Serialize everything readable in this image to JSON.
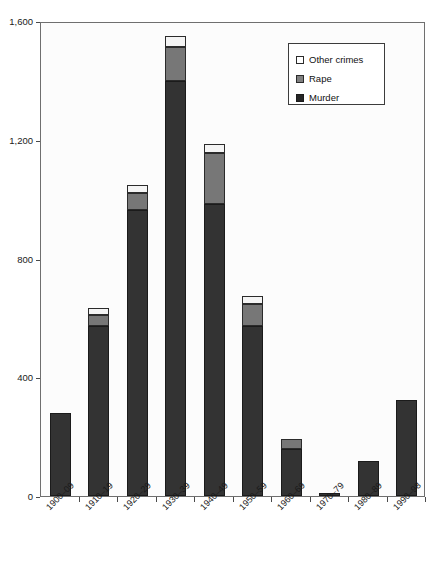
{
  "chart_data": {
    "type": "bar",
    "title": "",
    "xlabel": "",
    "ylabel": "",
    "ylim": [
      0,
      1600
    ],
    "yticks": [
      0,
      400,
      800,
      1200,
      1600
    ],
    "ytick_labels": [
      "0",
      "400",
      "800",
      "1,200",
      "1,600"
    ],
    "grid": false,
    "stacked": true,
    "legend_position": "top-right",
    "categories": [
      "1900–09",
      "1910–19",
      "1920–29",
      "1930–39",
      "1940–49",
      "1950–59",
      "1960–69",
      "1970–79",
      "1980–89",
      "1990–98"
    ],
    "series": [
      {
        "name": "Murder",
        "color": "#333333",
        "values": [
          280,
          573,
          963,
          1398,
          984,
          573,
          158,
          10,
          118,
          323
        ]
      },
      {
        "name": "Rape",
        "color": "#777777",
        "values": [
          0,
          37,
          57,
          114,
          171,
          74,
          34,
          0,
          0,
          0
        ]
      },
      {
        "name": "Other crimes",
        "color": "#f4f4f4",
        "values": [
          0,
          23,
          27,
          37,
          30,
          27,
          0,
          0,
          0,
          0
        ]
      }
    ],
    "totals": [
      280,
      633,
      1047,
      1549,
      1185,
      674,
      192,
      10,
      118,
      323
    ]
  },
  "legend": {
    "entries": [
      {
        "label": "Other crimes",
        "swatch": "other"
      },
      {
        "label": "Rape",
        "swatch": "rape"
      },
      {
        "label": "Murder",
        "swatch": "murder"
      }
    ]
  },
  "colors": {
    "murder": "#333333",
    "rape": "#777777",
    "other": "#f4f4f4",
    "axis": "#4a4a4a",
    "plot_background": "#fcfcfc"
  }
}
